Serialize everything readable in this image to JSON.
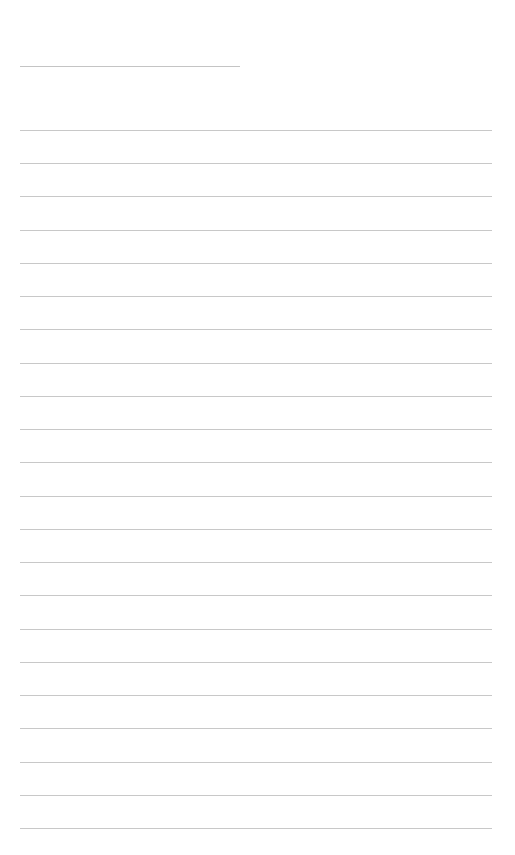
{
  "page": {
    "type": "lined-paper",
    "background": "#ffffff",
    "line_color": "#c8c8c8"
  },
  "header_line": {
    "x": 20,
    "y": 66,
    "width": 220
  },
  "ruled_lines": {
    "count": 22,
    "x": 20,
    "first_y": 130,
    "spacing": 33.24,
    "width": 472
  }
}
